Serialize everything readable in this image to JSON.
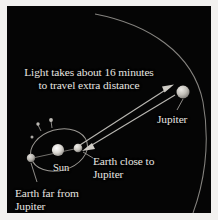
{
  "figure": {
    "background_color": "#f2f1ef",
    "sky_color": "#050505",
    "text_color": "#e8e6e1",
    "line_color": "#b9b7b2"
  },
  "caption": {
    "line1": "Light takes about 16 minutes",
    "line2": "to travel extra distance"
  },
  "labels": {
    "jupiter": "Jupiter",
    "earth_close": "Earth close to Jupiter",
    "earth_far": "Earth far from Jupiter",
    "sun": "Sun"
  },
  "bodies": [
    {
      "name": "sun",
      "cx": 51,
      "cy": 144,
      "r": 6.0,
      "color": "#d8d5cf"
    },
    {
      "name": "earth-close",
      "cx": 71,
      "cy": 142,
      "r": 4.2,
      "color": "#c9c6c0"
    },
    {
      "name": "earth-far",
      "cx": 24,
      "cy": 152,
      "r": 4.2,
      "color": "#b8b5af"
    },
    {
      "name": "jupiter",
      "cx": 176,
      "cy": 86,
      "r": 6.4,
      "color": "#c4c1ba"
    }
  ],
  "orbits": [
    {
      "name": "earth-orbit",
      "cx": 52,
      "cy": 144,
      "rx": 29,
      "ry": 21,
      "rotation": -16
    },
    {
      "name": "jupiter-orbit-arc"
    }
  ],
  "rays": [
    {
      "name": "light-ray-to-jupiter",
      "from": "earth-close",
      "to": "jupiter",
      "arrow": "end"
    },
    {
      "name": "light-ray-to-earth",
      "from": "jupiter",
      "to": "earth-close",
      "arrow": "end"
    }
  ],
  "leaders": [
    {
      "name": "leader-jupiter"
    },
    {
      "name": "leader-earth-close"
    },
    {
      "name": "leader-earth-far"
    }
  ]
}
